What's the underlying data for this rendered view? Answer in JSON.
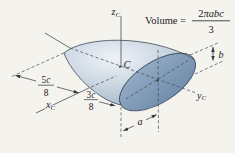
{
  "page": {
    "background": "#f4f3ee"
  },
  "figure": {
    "kind": "semi-ellipsoid-centroid-diagram",
    "colors": {
      "body_highlight": "#eff3f7",
      "body_mid": "#ccd8e3",
      "body_shadow": "#9db1c5",
      "face_top": "#96aec7",
      "face_bottom": "#7490ae",
      "outline": "#3e4853",
      "line": "#33373c",
      "dashed_line": "#44484d"
    },
    "formula": {
      "label_eq": "Volume =",
      "num_coeff": "2",
      "num_vars": "πabc",
      "den": "3"
    },
    "axes": {
      "z": {
        "letter": "z",
        "sub": "C"
      },
      "x": {
        "letter": "x",
        "sub": "C"
      },
      "y": {
        "letter": "y",
        "sub": "C"
      }
    },
    "centroid_label": "C",
    "dims": {
      "d58": {
        "num_coeff": "5",
        "num_var": "c",
        "den": "8"
      },
      "d38": {
        "num_coeff": "3",
        "num_var": "c",
        "den": "8"
      },
      "a": "a",
      "b": "b"
    }
  }
}
